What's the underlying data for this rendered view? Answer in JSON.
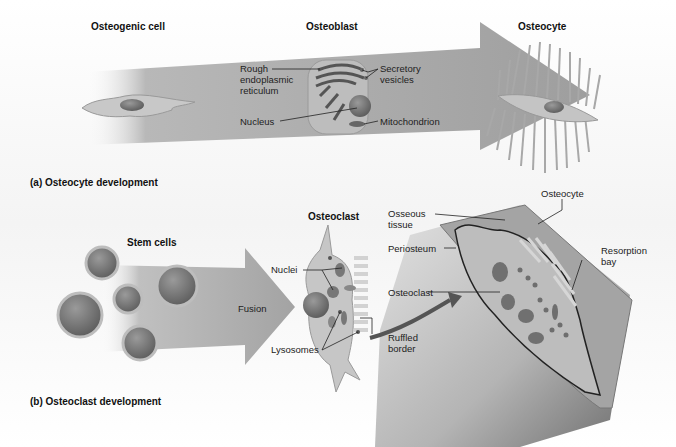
{
  "figure": {
    "panel_a": {
      "caption": "(a) Osteocyte development",
      "stages": {
        "osteogenic_cell": "Osteogenic cell",
        "osteoblast": "Osteoblast",
        "osteocyte": "Osteocyte"
      },
      "osteoblast_labels": {
        "rer_line1": "Rough",
        "rer_line2": "endoplasmic",
        "rer_line3": "reticulum",
        "nucleus": "Nucleus",
        "secretory_line1": "Secretory",
        "secretory_line2": "vesicles",
        "mitochondrion": "Mitochondrion"
      }
    },
    "panel_b": {
      "caption": "(b) Osteoclast development",
      "stem_cells": "Stem cells",
      "fusion": "Fusion",
      "osteoclast_title": "Osteoclast",
      "osteoclast_labels": {
        "nuclei": "Nuclei",
        "lysosomes": "Lysosomes",
        "ruffled_line1": "Ruffled",
        "ruffled_line2": "border"
      },
      "bone_labels": {
        "osseous_line1": "Osseous",
        "osseous_line2": "tissue",
        "periosteum": "Periosteum",
        "osteoclast": "Osteoclast",
        "osteocyte": "Osteocyte",
        "resorption_line1": "Resorption",
        "resorption_line2": "bay"
      }
    },
    "colors": {
      "arrow": "#a9a9a9",
      "cell_fill": "#c9c9c9",
      "nucleus": "#6b6b6b",
      "bone": "#9c9c9c",
      "text": "#1a1a1a"
    }
  }
}
